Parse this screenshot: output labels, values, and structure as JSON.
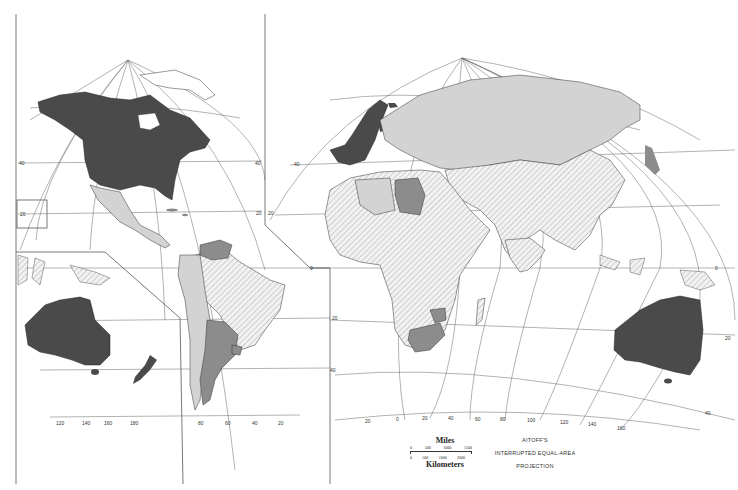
{
  "map": {
    "projection_title": [
      "AITOFF'S",
      "INTERRUPTED EQUAL-AREA",
      "PROJECTION"
    ],
    "scale": {
      "miles_label": "Miles",
      "km_label": "Kilometers",
      "miles_ticks": [
        "0",
        "500",
        "1000",
        "1500"
      ],
      "km_ticks": [
        "0",
        "500",
        "1000",
        "2000"
      ]
    },
    "colors": {
      "dark": "#4a4a4a",
      "medium": "#8c8c8c",
      "light": "#d3d3d3",
      "hatched": "#ececec",
      "line": "#444444"
    },
    "latitude_labels_left": [
      "60",
      "40",
      "20",
      "0",
      "20",
      "40",
      "60"
    ],
    "longitude_labels_bottom_left": [
      "120",
      "140",
      "160",
      "180",
      "80",
      "60",
      "40",
      "20"
    ],
    "longitude_labels_bottom_right": [
      "20",
      "0",
      "20",
      "40",
      "60",
      "80",
      "100",
      "120",
      "140",
      "160"
    ],
    "regions": [
      {
        "name": "North America (USA & Canada)",
        "shade": "dark"
      },
      {
        "name": "Mexico & Central America",
        "shade": "light"
      },
      {
        "name": "Venezuela",
        "shade": "medium"
      },
      {
        "name": "Brazil",
        "shade": "hatched"
      },
      {
        "name": "Argentina",
        "shade": "medium"
      },
      {
        "name": "Western Europe",
        "shade": "dark"
      },
      {
        "name": "Russia / USSR",
        "shade": "light"
      },
      {
        "name": "Libya",
        "shade": "medium"
      },
      {
        "name": "Africa (most)",
        "shade": "hatched"
      },
      {
        "name": "South Africa",
        "shade": "medium"
      },
      {
        "name": "Zimbabwe",
        "shade": "medium"
      },
      {
        "name": "China & South Asia",
        "shade": "hatched"
      },
      {
        "name": "Japan",
        "shade": "medium"
      },
      {
        "name": "Australia",
        "shade": "dark"
      },
      {
        "name": "New Zealand",
        "shade": "dark"
      }
    ]
  }
}
